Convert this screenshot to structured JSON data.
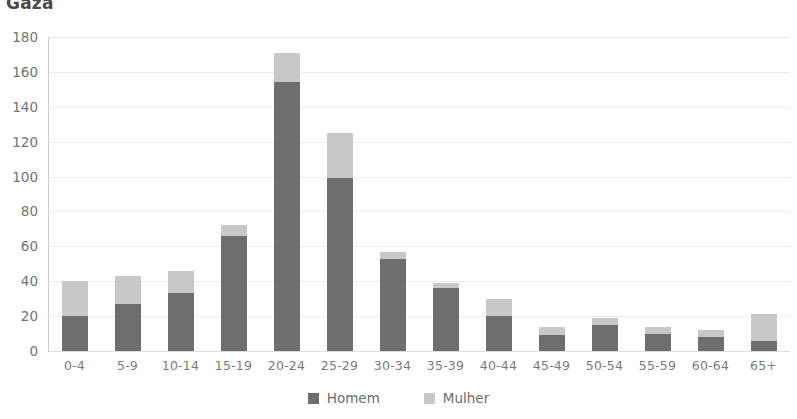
{
  "chart_data": {
    "type": "bar",
    "subtype": "stacked-column",
    "title": "Gaza",
    "xlabel": "",
    "ylabel": "",
    "ylim": [
      0,
      180
    ],
    "ytick_step": 20,
    "yticks": [
      180,
      160,
      140,
      120,
      100,
      80,
      60,
      40,
      20,
      0
    ],
    "ytick_labels": [
      "180",
      "160",
      "140",
      "120",
      "100",
      "80",
      "60",
      "40",
      "20",
      "0"
    ],
    "grid": true,
    "legend_position": "bottom-center",
    "categories": [
      "0-4",
      "5-9",
      "10-14",
      "15-19",
      "20-24",
      "25-29",
      "30-34",
      "35-39",
      "40-44",
      "45-49",
      "50-54",
      "55-59",
      "60-64",
      "65+"
    ],
    "series": [
      {
        "name": "Homem",
        "color": "#6e6e6e",
        "values": [
          20,
          27,
          33,
          66,
          154,
          99,
          53,
          36,
          20,
          9,
          15,
          10,
          8,
          6
        ]
      },
      {
        "name": "Mulher",
        "color": "#c8c8c8",
        "values": [
          20,
          16,
          13,
          6,
          17,
          26,
          4,
          3,
          10,
          5,
          4,
          4,
          4,
          15
        ]
      }
    ],
    "totals": [
      40,
      43,
      46,
      72,
      171,
      125,
      57,
      39,
      30,
      14,
      19,
      14,
      12,
      21
    ]
  },
  "legend": {
    "items": [
      {
        "label": "Homem",
        "color": "#6e6e6e"
      },
      {
        "label": "Mulher",
        "color": "#c8c8c8"
      }
    ]
  },
  "colors": {
    "male": "#6e6e6e",
    "female": "#c8c8c8",
    "grid": "#e4ecf1",
    "axis": "#c9cdd0",
    "text": "#6b6b6b",
    "title": "#4a4a4a",
    "background": "#ffffff"
  }
}
